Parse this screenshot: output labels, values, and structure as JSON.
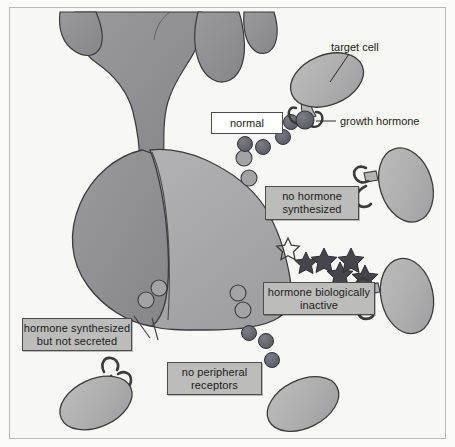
{
  "figure": {
    "background_color": "#f7f7f5",
    "border_color": "#b9b9b5"
  },
  "palette": {
    "gland_dark": "#8f8f93",
    "gland_mid": "#9b9b9e",
    "gland_light": "#a9a9ab",
    "cell_fill": "#adadae",
    "hormone_fill": "#636369",
    "star_fill": "#45454b",
    "outline": "#3b3b3b",
    "callout_fill": "#bcbcba",
    "callout_white": "#ffffff",
    "text": "#1b1b1b"
  },
  "callouts": [
    {
      "id": "normal",
      "text": "normal",
      "style": "white",
      "left": 211,
      "top": 112,
      "width": 72,
      "height": 22,
      "font_size": 11
    },
    {
      "id": "no-hormone-synthesized",
      "text": "no hormone\nsynthesized",
      "style": "gray",
      "left": 265,
      "top": 186,
      "width": 94,
      "height": 34,
      "font_size": 11
    },
    {
      "id": "hormone-biologically-inactive",
      "text": "hormone biologically\ninactive",
      "style": "gray",
      "left": 263,
      "top": 282,
      "width": 112,
      "height": 33,
      "font_size": 11
    },
    {
      "id": "hormone-synthesized-but-not-secreted",
      "text": "hormone synthesized\nbut not secreted",
      "style": "gray",
      "left": 22,
      "top": 318,
      "width": 110,
      "height": 33,
      "font_size": 11
    },
    {
      "id": "no-peripheral-receptors",
      "text": "no peripheral\nreceptors",
      "style": "gray",
      "left": 167,
      "top": 362,
      "width": 95,
      "height": 33,
      "font_size": 11
    }
  ],
  "leader_labels": [
    {
      "id": "target-cell",
      "text": "target cell",
      "left": 331,
      "top": 41,
      "font_size": 11
    },
    {
      "id": "growth-hormone",
      "text": "growth hormone",
      "left": 340,
      "top": 115,
      "font_size": 11
    }
  ],
  "anatomy": {
    "hypothalamus_label": "hypothalamus stalk",
    "pituitary_label": "pituitary gland",
    "lobes": 4
  },
  "target_cells": [
    {
      "id": "cell-normal",
      "cx": 327,
      "cy": 80,
      "has_receptor": true,
      "hormone_bound": true
    },
    {
      "id": "cell-no-hormone",
      "cx": 404,
      "cy": 185,
      "has_receptor": true,
      "hormone_bound": false
    },
    {
      "id": "cell-inactive",
      "cx": 404,
      "cy": 295,
      "has_receptor": true,
      "hormone_bound": false
    },
    {
      "id": "cell-not-secreted",
      "cx": 97,
      "cy": 400,
      "has_receptor": true,
      "hormone_bound": false
    },
    {
      "id": "cell-no-receptors",
      "cx": 303,
      "cy": 405,
      "has_receptor": false,
      "hormone_bound": false
    }
  ],
  "hormone_particles": {
    "normal_trail_count": 5,
    "bottom_trail_count": 4,
    "trapped_vesicle_count": 4
  },
  "inactive_hormones": {
    "star_count": 6,
    "outlined_count": 1,
    "filled_count": 5
  }
}
